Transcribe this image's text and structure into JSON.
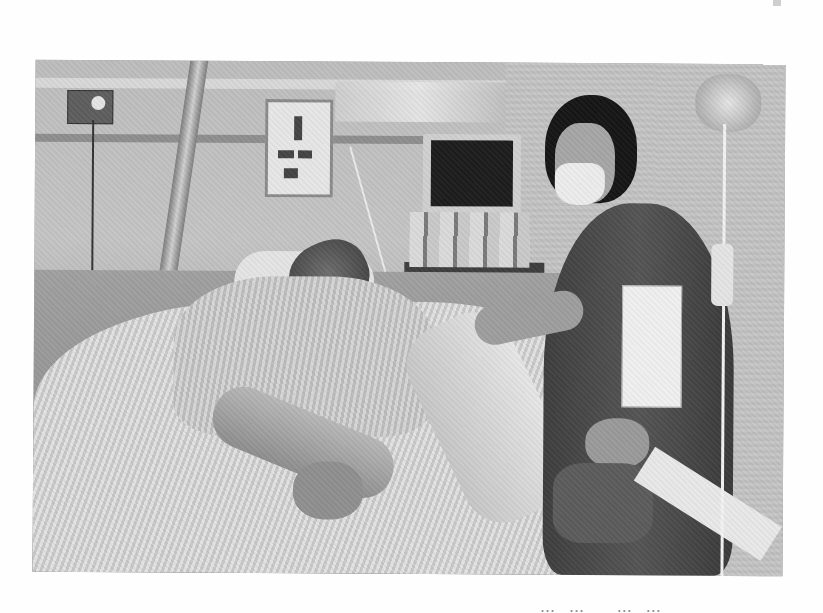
{
  "page": {
    "background": "#fefefe",
    "type": "scanned page with photograph"
  },
  "photo": {
    "description": "Black-and-white photograph of a hospital room: a patient lying in a bed under striped blankets while a woman wearing a surgical face mask stands beside the bed holding a folder; medical equipment, a monitor, bottles on a bedside table, and an IV drip hang in the scene.",
    "tone": "grayscale",
    "elements": [
      "patient-in-bed",
      "woman-with-face-mask",
      "bedside-monitor",
      "iv-drip-bag",
      "wall-outlet-panel",
      "wall-poster",
      "bed-rail",
      "bedside-table-with-bottles",
      "striped-blankets",
      "folder"
    ]
  },
  "caption": {
    "text": "…… …… …… ……",
    "note": "cropped characters along the bottom edge, illegible"
  }
}
